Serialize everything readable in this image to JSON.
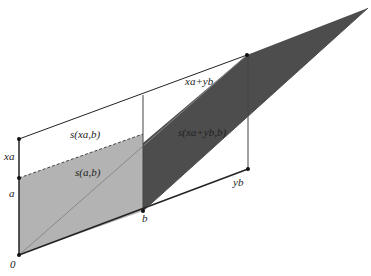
{
  "diagram": {
    "type": "geometric-area-diagram",
    "labels": {
      "origin": "0",
      "a": "a",
      "xa": "xa",
      "b": "b",
      "yb": "yb",
      "xa_plus_yb": "xa+yb",
      "s_xa_b": "s(xa,b)",
      "s_a_b": "s(a,b)",
      "s_xa_yb_b": "s(xa+yb,b)"
    },
    "colors": {
      "light_region": "#b3b3b3",
      "dark_region": "#4d4d4d",
      "lines": "#222222"
    }
  }
}
